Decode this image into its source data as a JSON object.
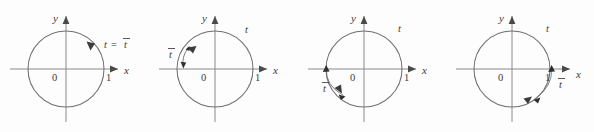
{
  "figure": {
    "kind": "unit-circle-reference-angle-diagram",
    "panel_count": 4,
    "background_color": "#fdfdfd",
    "line_color": "#6f6f6f",
    "label_color": "#3a3a3a"
  },
  "axis_labels": {
    "x": "x",
    "y": "y",
    "origin": "0",
    "unit": "1"
  },
  "panels": [
    {
      "id": "panel-1",
      "quadrant": "I",
      "t_label": "t",
      "equals": "=",
      "tbar_label": "t",
      "combined_label": "t = t̄",
      "arc_arrow_direction": "counterclockwise",
      "terminal_quadrant_note": "terminal side in quadrant I; t equals its reference angle"
    },
    {
      "id": "panel-2",
      "quadrant": "II",
      "t_label": "t",
      "tbar_label": "t",
      "arc_arrow_direction": "counterclockwise",
      "terminal_quadrant_note": "terminal side in quadrant II; reference angle measured to negative x-axis"
    },
    {
      "id": "panel-3",
      "quadrant": "III",
      "t_label": "t",
      "tbar_label": "t",
      "arc_arrow_direction": "counterclockwise",
      "terminal_quadrant_note": "terminal side in quadrant III; reference angle measured from negative x-axis"
    },
    {
      "id": "panel-4",
      "quadrant": "IV",
      "t_label": "t",
      "tbar_label": "t",
      "arc_arrow_direction": "counterclockwise",
      "terminal_quadrant_note": "terminal side in quadrant IV; reference angle measured to positive x-axis"
    }
  ]
}
